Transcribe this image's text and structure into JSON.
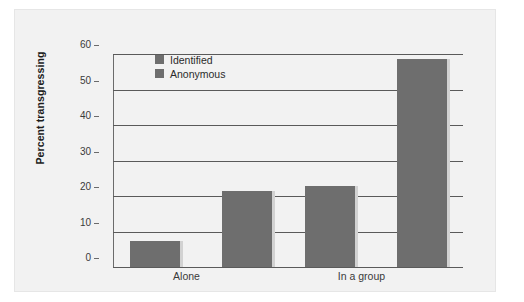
{
  "chart_data": {
    "type": "bar",
    "title": "",
    "subtitle": "",
    "xlabel": "",
    "ylabel": "Percent transgressing",
    "categories": [
      "Alone",
      "In a group"
    ],
    "series": [
      {
        "name": "Identified",
        "values": [
          7.3,
          22.7
        ],
        "color": "#6e6e6e"
      },
      {
        "name": "Anonymous",
        "values": [
          21.5,
          58.5
        ],
        "color": "#6e6e6e"
      }
    ],
    "ylim": [
      0,
      60
    ],
    "ytick_step": 10,
    "yticks": [
      0,
      10,
      20,
      30,
      40,
      50,
      60
    ],
    "ytick_labels": [
      "0",
      "10",
      "20",
      "30",
      "40",
      "50",
      "60"
    ],
    "grid": true,
    "grid_axis": "y",
    "legend_position": "top-left-inside",
    "legend_entries": [
      "Identified",
      "Anonymous"
    ],
    "annotations": [],
    "background_color": "#f2f2f2",
    "bar_color": "#6e6e6e",
    "bar_shadow_color": "#d2d2d2",
    "axis_color": "#5a5a5a"
  }
}
